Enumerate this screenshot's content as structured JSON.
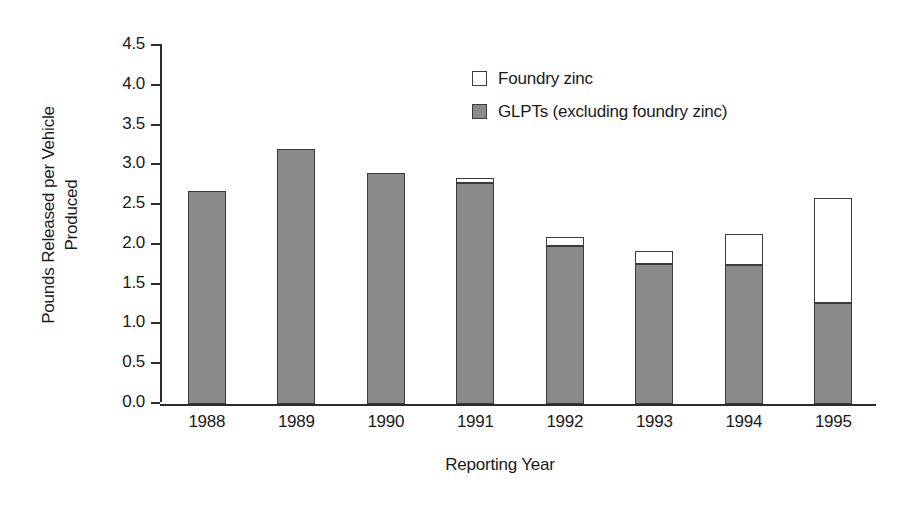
{
  "chart_data": {
    "type": "bar",
    "title": "",
    "subtitle": "",
    "xlabel": "Reporting Year",
    "ylabel": "Pounds Released per Vehicle Produced",
    "ylabel_lines": [
      "Pounds Released per Vehicle",
      "Produced"
    ],
    "categories": [
      "1988",
      "1989",
      "1990",
      "1991",
      "1992",
      "1993",
      "1994",
      "1995"
    ],
    "stacked": true,
    "series": [
      {
        "name": "GLPTs (excluding foundry zinc)",
        "color": "#8a8a8a",
        "values": [
          2.68,
          3.21,
          2.9,
          2.78,
          1.98,
          1.76,
          1.75,
          1.27
        ]
      },
      {
        "name": "Foundry zinc",
        "color": "#ffffff",
        "values": [
          0.0,
          0.0,
          0.0,
          0.06,
          0.12,
          0.16,
          0.39,
          1.32
        ]
      }
    ],
    "totals": [
      2.68,
      3.21,
      2.9,
      2.84,
      2.1,
      1.92,
      2.14,
      2.59
    ],
    "ylim": [
      0.0,
      4.5
    ],
    "ytick_values": [
      0.0,
      0.5,
      1.0,
      1.5,
      2.0,
      2.5,
      3.0,
      3.5,
      4.0,
      4.5
    ],
    "ytick_labels": [
      "0.0",
      "0.5",
      "1.0",
      "1.5",
      "2.0",
      "2.5",
      "3.0",
      "3.5",
      "4.0",
      "4.5"
    ],
    "grid": false,
    "legend_position": "upper center",
    "legend_entries": [
      {
        "label": "Foundry zinc",
        "swatch": "white"
      },
      {
        "label": "GLPTs (excluding foundry zinc)",
        "swatch": "gray"
      }
    ]
  },
  "colors": {
    "glpt_gray": "#8a8a8a",
    "foundry_white": "#ffffff",
    "outline": "#3a3a3a",
    "axis": "#2b2b2b",
    "text": "#1a1a1a",
    "background": "#ffffff"
  }
}
